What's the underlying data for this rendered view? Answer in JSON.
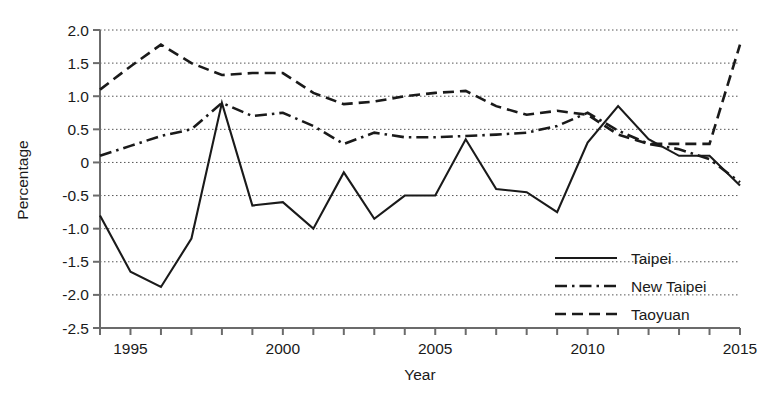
{
  "chart_data": {
    "type": "line",
    "title": "",
    "xlabel": "Year",
    "ylabel": "Percentage",
    "xlim": [
      1994,
      2015
    ],
    "ylim": [
      -2.5,
      2.0
    ],
    "yticks": [
      "2.0",
      "1.5",
      "1.0",
      "0.5",
      "0",
      "-0.5",
      "-1.0",
      "-1.5",
      "-2.0",
      "-2.5"
    ],
    "ytick_values": [
      2.0,
      1.5,
      1.0,
      0.5,
      0,
      -0.5,
      -1.0,
      -1.5,
      -2.0,
      -2.5
    ],
    "xticks": [
      "1995",
      "2000",
      "2005",
      "2010",
      "2015"
    ],
    "xtick_values": [
      1995,
      2000,
      2005,
      2010,
      2015
    ],
    "x": [
      1994,
      1995,
      1996,
      1997,
      1998,
      1999,
      2000,
      2001,
      2002,
      2003,
      2004,
      2005,
      2006,
      2007,
      2008,
      2009,
      2010,
      2011,
      2012,
      2013,
      2014,
      2015
    ],
    "grid": true,
    "grid_axis": "y",
    "legend_position": "bottom-right",
    "series": [
      {
        "name": "Taipei",
        "style": "solid",
        "color": "#1a1a1a",
        "values": [
          -0.8,
          -1.65,
          -1.88,
          -1.15,
          0.9,
          -0.65,
          -0.6,
          -1.0,
          -0.15,
          -0.85,
          -0.5,
          -0.5,
          0.35,
          -0.4,
          -0.45,
          -0.75,
          0.3,
          0.85,
          0.35,
          0.1,
          0.1,
          -0.35
        ]
      },
      {
        "name": "New Taipei",
        "style": "dashdot",
        "color": "#1a1a1a",
        "values": [
          0.1,
          0.25,
          0.4,
          0.5,
          0.9,
          0.7,
          0.75,
          0.55,
          0.28,
          0.45,
          0.38,
          0.38,
          0.4,
          0.42,
          0.45,
          0.55,
          0.75,
          0.48,
          0.28,
          0.2,
          0.05,
          -0.3
        ]
      },
      {
        "name": "Taoyuan",
        "style": "dashed",
        "color": "#1a1a1a",
        "values": [
          1.1,
          1.45,
          1.78,
          1.5,
          1.32,
          1.35,
          1.35,
          1.05,
          0.88,
          0.92,
          1.0,
          1.05,
          1.08,
          0.85,
          0.72,
          0.78,
          0.72,
          0.42,
          0.28,
          0.28,
          0.28,
          1.78
        ]
      }
    ]
  },
  "legend": {
    "items": [
      {
        "label": "Taipei",
        "style": "solid"
      },
      {
        "label": "New Taipei",
        "style": "dashdot"
      },
      {
        "label": "Taoyuan",
        "style": "dashed"
      }
    ]
  },
  "axes": {
    "x_title": "Year",
    "y_title": "Percentage"
  }
}
